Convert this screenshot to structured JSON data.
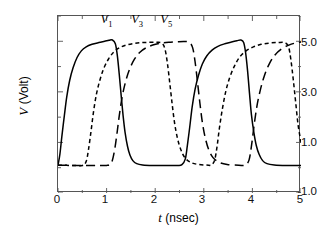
{
  "chart_data": {
    "type": "line",
    "title": "",
    "xlabel": "t (nsec)",
    "ylabel": "V (Volt)",
    "xlim": [
      0,
      5
    ],
    "ylim": [
      -1.0,
      6.0
    ],
    "grid": false,
    "legend_position": "inside-top",
    "x_ticks": [
      {
        "value": 0,
        "label": "0"
      },
      {
        "value": 1,
        "label": "1"
      },
      {
        "value": 2,
        "label": "2"
      },
      {
        "value": 3,
        "label": "3"
      },
      {
        "value": 4,
        "label": "4"
      },
      {
        "value": 5,
        "label": "5"
      }
    ],
    "x_minor_ticks": [
      0.5,
      1.5,
      2.5,
      3.5,
      4.5
    ],
    "y_ticks": [
      {
        "value": -1.0,
        "label": "-1.0"
      },
      {
        "value": 1.0,
        "label": "1.0"
      },
      {
        "value": 3.0,
        "label": "3.0"
      },
      {
        "value": 5.0,
        "label": "5.0"
      }
    ],
    "y_minor_ticks": [
      0.0,
      2.0,
      4.0,
      6.0
    ],
    "units": {
      "x": "nsec",
      "y": "Volt"
    },
    "low_level": 0.1,
    "high_level": 5.05,
    "period": 2.6,
    "phase_shift": 0.65,
    "series": [
      {
        "name": "V1",
        "label": "V",
        "subscript": "1",
        "style": "solid",
        "color": "#000000",
        "label_x": 1.02,
        "label_y": 5.85,
        "points": [
          [
            0.0,
            0.1
          ],
          [
            0.04,
            0.55
          ],
          [
            0.08,
            1.25
          ],
          [
            0.13,
            2.05
          ],
          [
            0.18,
            2.8
          ],
          [
            0.24,
            3.45
          ],
          [
            0.31,
            3.95
          ],
          [
            0.39,
            4.35
          ],
          [
            0.48,
            4.62
          ],
          [
            0.58,
            4.78
          ],
          [
            0.7,
            4.88
          ],
          [
            0.84,
            4.95
          ],
          [
            0.96,
            5.0
          ],
          [
            1.05,
            5.04
          ],
          [
            1.12,
            5.05
          ],
          [
            1.18,
            4.9
          ],
          [
            1.22,
            4.45
          ],
          [
            1.26,
            3.7
          ],
          [
            1.3,
            2.85
          ],
          [
            1.34,
            2.05
          ],
          [
            1.38,
            1.4
          ],
          [
            1.43,
            0.85
          ],
          [
            1.48,
            0.5
          ],
          [
            1.54,
            0.28
          ],
          [
            1.62,
            0.16
          ],
          [
            1.74,
            0.11
          ],
          [
            1.95,
            0.09
          ],
          [
            2.25,
            0.09
          ],
          [
            2.45,
            0.09
          ],
          [
            2.55,
            0.12
          ],
          [
            2.62,
            0.35
          ],
          [
            2.66,
            0.85
          ],
          [
            2.71,
            1.6
          ],
          [
            2.76,
            2.4
          ],
          [
            2.82,
            3.1
          ],
          [
            2.89,
            3.65
          ],
          [
            2.97,
            4.1
          ],
          [
            3.06,
            4.42
          ],
          [
            3.17,
            4.65
          ],
          [
            3.29,
            4.8
          ],
          [
            3.43,
            4.9
          ],
          [
            3.57,
            4.97
          ],
          [
            3.68,
            5.02
          ],
          [
            3.76,
            5.05
          ],
          [
            3.82,
            4.95
          ],
          [
            3.86,
            4.55
          ],
          [
            3.9,
            3.85
          ],
          [
            3.94,
            2.95
          ],
          [
            3.98,
            2.1
          ],
          [
            4.03,
            1.4
          ],
          [
            4.08,
            0.88
          ],
          [
            4.14,
            0.52
          ],
          [
            4.21,
            0.28
          ],
          [
            4.3,
            0.16
          ],
          [
            4.45,
            0.11
          ],
          [
            4.7,
            0.09
          ],
          [
            5.0,
            0.09
          ]
        ]
      },
      {
        "name": "V3",
        "label": "V",
        "subscript": "3",
        "style": "short-dash",
        "color": "#000000",
        "label_x": 1.65,
        "label_y": 5.85,
        "points": [
          [
            0.0,
            0.1
          ],
          [
            0.3,
            0.09
          ],
          [
            0.5,
            0.09
          ],
          [
            0.58,
            0.25
          ],
          [
            0.63,
            0.75
          ],
          [
            0.68,
            1.45
          ],
          [
            0.73,
            2.2
          ],
          [
            0.79,
            2.9
          ],
          [
            0.86,
            3.45
          ],
          [
            0.94,
            3.92
          ],
          [
            1.04,
            4.3
          ],
          [
            1.15,
            4.58
          ],
          [
            1.28,
            4.76
          ],
          [
            1.42,
            4.86
          ],
          [
            1.58,
            4.92
          ],
          [
            1.74,
            4.95
          ],
          [
            1.9,
            4.96
          ],
          [
            2.04,
            4.96
          ],
          [
            2.14,
            4.92
          ],
          [
            2.2,
            4.7
          ],
          [
            2.25,
            4.15
          ],
          [
            2.3,
            3.35
          ],
          [
            2.35,
            2.5
          ],
          [
            2.4,
            1.75
          ],
          [
            2.46,
            1.15
          ],
          [
            2.53,
            0.7
          ],
          [
            2.61,
            0.4
          ],
          [
            2.72,
            0.22
          ],
          [
            2.88,
            0.13
          ],
          [
            3.1,
            0.1
          ],
          [
            3.15,
            0.1
          ],
          [
            3.22,
            0.28
          ],
          [
            3.27,
            0.8
          ],
          [
            3.32,
            1.55
          ],
          [
            3.38,
            2.3
          ],
          [
            3.45,
            3.0
          ],
          [
            3.53,
            3.55
          ],
          [
            3.63,
            4.02
          ],
          [
            3.74,
            4.38
          ],
          [
            3.87,
            4.62
          ],
          [
            4.02,
            4.78
          ],
          [
            4.18,
            4.88
          ],
          [
            4.35,
            4.93
          ],
          [
            4.52,
            4.95
          ],
          [
            4.66,
            4.95
          ],
          [
            4.74,
            4.8
          ],
          [
            4.79,
            4.3
          ],
          [
            4.84,
            3.5
          ],
          [
            4.89,
            2.6
          ],
          [
            4.94,
            1.7
          ],
          [
            5.0,
            1.0
          ]
        ]
      },
      {
        "name": "V5",
        "label": "V",
        "subscript": "5",
        "style": "long-dash",
        "color": "#000000",
        "label_x": 2.25,
        "label_y": 5.85,
        "points": [
          [
            0.0,
            0.1
          ],
          [
            0.4,
            0.09
          ],
          [
            0.8,
            0.09
          ],
          [
            1.0,
            0.09
          ],
          [
            1.1,
            0.2
          ],
          [
            1.16,
            0.65
          ],
          [
            1.21,
            1.3
          ],
          [
            1.26,
            2.05
          ],
          [
            1.32,
            2.8
          ],
          [
            1.39,
            3.4
          ],
          [
            1.47,
            3.88
          ],
          [
            1.57,
            4.28
          ],
          [
            1.68,
            4.56
          ],
          [
            1.81,
            4.74
          ],
          [
            1.95,
            4.85
          ],
          [
            2.11,
            4.92
          ],
          [
            2.28,
            4.96
          ],
          [
            2.45,
            4.98
          ],
          [
            2.6,
            4.99
          ],
          [
            2.7,
            4.96
          ],
          [
            2.77,
            4.75
          ],
          [
            2.82,
            4.2
          ],
          [
            2.87,
            3.4
          ],
          [
            2.92,
            2.55
          ],
          [
            2.97,
            1.8
          ],
          [
            3.03,
            1.18
          ],
          [
            3.1,
            0.72
          ],
          [
            3.19,
            0.4
          ],
          [
            3.31,
            0.22
          ],
          [
            3.48,
            0.13
          ],
          [
            3.72,
            0.1
          ],
          [
            3.85,
            0.1
          ],
          [
            3.93,
            0.3
          ],
          [
            3.98,
            0.85
          ],
          [
            4.03,
            1.6
          ],
          [
            4.09,
            2.4
          ],
          [
            4.16,
            3.05
          ],
          [
            4.24,
            3.6
          ],
          [
            4.34,
            4.08
          ],
          [
            4.46,
            4.45
          ],
          [
            4.6,
            4.7
          ],
          [
            4.75,
            4.85
          ],
          [
            4.88,
            4.93
          ],
          [
            5.0,
            4.97
          ]
        ]
      }
    ]
  },
  "axes": {
    "ylabel_var": "V",
    "ylabel_unit": "(Volt)",
    "xlabel_var": "t",
    "xlabel_unit": "(nsec)"
  }
}
